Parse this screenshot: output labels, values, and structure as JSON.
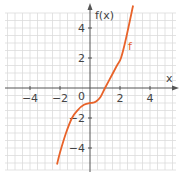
{
  "chart_data": {
    "type": "line",
    "title": "",
    "xlabel": "x",
    "ylabel": "f(x)",
    "xlim": [
      -5.8,
      6
    ],
    "ylim": [
      -5.8,
      5.8
    ],
    "grid": true,
    "x_ticks": [
      -4,
      -2,
      2,
      4
    ],
    "y_ticks": [
      4,
      2,
      -2,
      -4
    ],
    "origin_label": "0",
    "series": [
      {
        "name": "f",
        "color": "#e8632a",
        "x": [
          -2.2,
          -2.0,
          -1.6,
          -1.2,
          -0.8,
          -0.4,
          0.0,
          0.2,
          0.4,
          0.7,
          1.0,
          1.4,
          1.8,
          2.07,
          2.4,
          2.87
        ],
        "values": [
          -5.1,
          -4.3,
          -3.0,
          -2.0,
          -1.45,
          -1.12,
          -1.0,
          -0.98,
          -0.9,
          -0.6,
          0.0,
          0.75,
          1.5,
          2.0,
          3.3,
          5.5
        ]
      }
    ],
    "annotations": [
      {
        "text": "f",
        "x": 2.55,
        "y": 2.7
      }
    ]
  },
  "labels": {
    "x_axis": "x",
    "y_axis": "f(x)",
    "origin": "0",
    "curve": "f",
    "xt_m4": "−4",
    "xt_m2": "−2",
    "xt_2": "2",
    "xt_4": "4",
    "yt_4": "4",
    "yt_2": "2",
    "yt_m2": "−2",
    "yt_m4": "−4"
  },
  "colors": {
    "curve": "#e8632a",
    "axis": "#555555",
    "grid": "#dcdcdc"
  }
}
